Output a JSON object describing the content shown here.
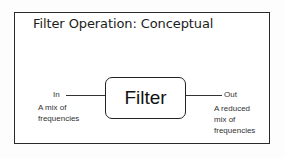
{
  "title": "Filter Operation: Conceptual",
  "diagram": {
    "block": {
      "label": "Filter"
    },
    "input": {
      "label": "In",
      "description_lines": [
        "A mix of",
        "frequencies"
      ]
    },
    "output": {
      "label": "Out",
      "description_lines": [
        "A reduced",
        "mix of",
        "frequencies"
      ]
    }
  },
  "colors": {
    "border": "#2a2a2a",
    "text": "#1c1c1c",
    "background": "#ffffff"
  }
}
